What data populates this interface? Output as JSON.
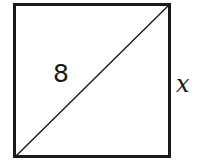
{
  "figure": {
    "type": "geometry-diagram",
    "shape": "square",
    "background_color": "#ffffff",
    "stroke_color": "#1a1a1a",
    "square": {
      "x": 13,
      "y": 3,
      "width": 158,
      "height": 155,
      "border_width": 3
    },
    "diagonal": {
      "x1": 16,
      "y1": 156,
      "x2": 169,
      "y2": 5,
      "stroke_width": 1.4
    },
    "labels": [
      {
        "name": "diagonal-length",
        "text": "8",
        "style": "upright",
        "position": "inside-left-of-diagonal"
      },
      {
        "name": "side-length",
        "text": "x",
        "style": "italic",
        "position": "outside-right-edge"
      }
    ]
  }
}
